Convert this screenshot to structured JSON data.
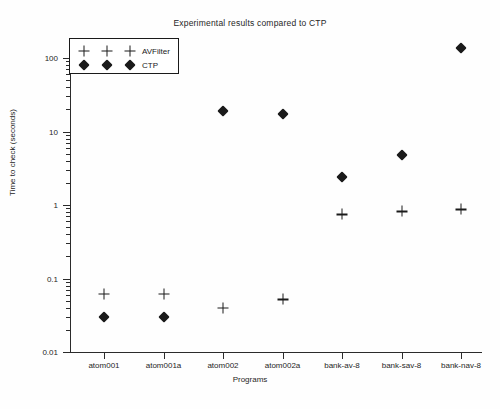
{
  "chart_data": {
    "type": "scatter",
    "title": "Experimental results compared to CTP",
    "xlabel": "Programs",
    "ylabel": "Time to check (seconds)",
    "yscale": "log",
    "ylim": [
      0.01,
      200
    ],
    "ytick_labels": [
      "0.01",
      "0.1",
      "1",
      "10",
      "100"
    ],
    "ytick_values": [
      0.01,
      0.1,
      1,
      10,
      100
    ],
    "grid": false,
    "legend_position": "upper-left",
    "categories": [
      "atom001",
      "atom001a",
      "atom002",
      "atom002a",
      "bank-av-8",
      "bank-sav-8",
      "bank-nav-8"
    ],
    "series": [
      {
        "name": "AVFilter",
        "marker": "plus",
        "color": "#1a1a1a",
        "values": [
          0.062,
          0.062,
          0.04,
          0.052,
          0.75,
          0.82,
          0.87
        ]
      },
      {
        "name": "CTP",
        "marker": "diamond",
        "color": "#1a1a1a",
        "values": [
          0.03,
          0.03,
          19.0,
          17.5,
          2.4,
          4.8,
          135.0
        ]
      }
    ]
  },
  "legend": {
    "entries": [
      {
        "label": "AVFilter",
        "marker": "plus"
      },
      {
        "label": "CTP",
        "marker": "diamond"
      }
    ]
  }
}
